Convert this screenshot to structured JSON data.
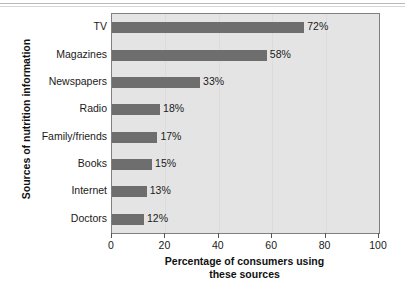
{
  "chart_data": {
    "type": "bar",
    "orientation": "horizontal",
    "title": "",
    "xlabel_line1": "Percentage of consumers using",
    "xlabel_line2": "these sources",
    "ylabel": "Sources of nutrition information",
    "categories": [
      "TV",
      "Magazines",
      "Newspapers",
      "Radio",
      "Family/friends",
      "Books",
      "Internet",
      "Doctors"
    ],
    "values": [
      72,
      58,
      33,
      18,
      17,
      15,
      13,
      12
    ],
    "value_labels": [
      "72%",
      "58%",
      "33%",
      "18%",
      "17%",
      "15%",
      "13%",
      "12%"
    ],
    "xlim": [
      0,
      100
    ],
    "xticks": [
      0,
      20,
      40,
      60,
      80,
      100
    ],
    "xtick_labels": [
      "0",
      "20",
      "40",
      "60",
      "80",
      "100"
    ],
    "grid": false,
    "legend": null,
    "colors": {
      "bar": "#6e6e6e",
      "plot_background": "#e4e4e4",
      "frame": "#808080",
      "text": "#1a1a1a",
      "page_background": "#ffffff"
    }
  }
}
